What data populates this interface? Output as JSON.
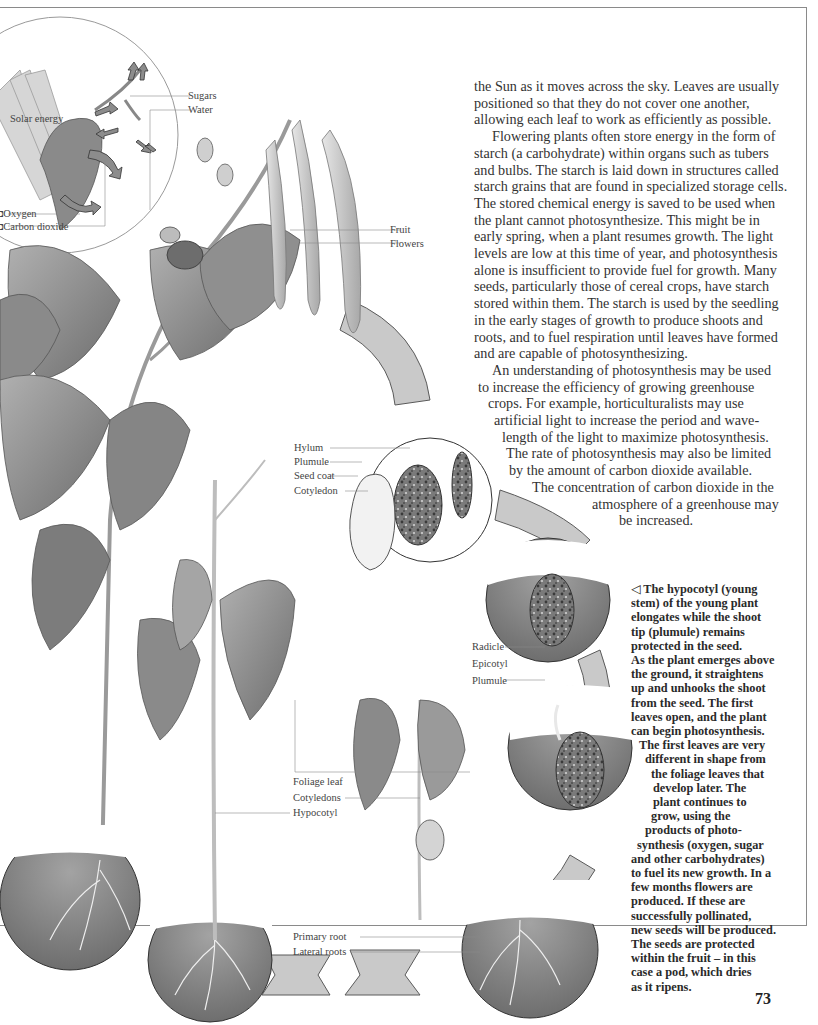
{
  "page": {
    "number": "73"
  },
  "body_text": {
    "paragraphs": [
      {
        "lines": [
          "the Sun as it moves across the sky. Leaves are usually",
          "positioned so that they do not cover one another,",
          "allowing each leaf to work as efficiently as possible."
        ]
      },
      {
        "lines": [
          "Flowering plants often store energy in the form of",
          "starch (a carbohydrate) within organs such as tubers",
          "and bulbs. The starch is laid down in structures called",
          "starch grains that are found in specialized storage cells.",
          "The stored chemical energy is saved to be used when",
          "the plant cannot photosynthesize. This might be in",
          "early spring, when a plant resumes growth. The light",
          "levels are low at this time of year, and photosynthesis",
          "alone is insufficient to provide fuel for growth. Many",
          "seeds, particularly those of cereal crops, have starch",
          "stored within them. The starch is used by the seedling",
          "in the early stages of growth to produce shoots and",
          "roots, and to fuel respiration until leaves have formed",
          "and are capable of photosynthesizing."
        ]
      },
      {
        "lines": [
          "An understanding of photosynthesis may be used",
          "to increase the efficiency of growing greenhouse",
          "crops. For example, horticulturalists may use",
          "artificial light to increase the period and wave-",
          "length of the light to maximize photosynthesis.",
          "The rate of photosynthesis may also be limited",
          "by the amount of carbon dioxide available.",
          "The concentration of carbon dioxide in the",
          "atmosphere of a greenhouse may",
          "be increased."
        ]
      }
    ]
  },
  "caption": {
    "marker": "◁",
    "lines": [
      "The hypocotyl (young",
      "stem) of the young plant",
      "elongates while the shoot",
      "tip (plumule) remains",
      "protected in the seed.",
      "As the plant emerges above",
      "the ground, it straightens",
      "up and unhooks the shoot",
      "from the seed. The first",
      "leaves open, and the plant",
      "can begin photosynthesis.",
      "The first leaves are very",
      "different in shape from",
      "the foliage leaves that",
      "develop later. The",
      "plant continues to",
      "grow, using the",
      "products of photo-",
      "synthesis (oxygen, sugar",
      "and other carbohydrates)",
      "to fuel its new growth. In a",
      "few months flowers are",
      "produced. If these are",
      "successfully pollinated,",
      "new seeds will be produced.",
      "The seeds are protected",
      "within the fruit – in this",
      "case a pod, which dries",
      "as it ripens."
    ]
  },
  "diagram_labels": {
    "inset": {
      "solar_energy": "Solar energy",
      "sugars": "Sugars",
      "water": "Water",
      "oxygen": "Oxygen",
      "carbon_dioxide": "Carbon dioxide"
    },
    "mature_plant": {
      "fruit": "Fruit",
      "flowers": "Flowers"
    },
    "seed": {
      "hylum": "Hylum",
      "plumule": "Plumule",
      "seed_coat": "Seed coat",
      "cotyledon": "Cotyledon"
    },
    "germination": {
      "radicle": "Radicle",
      "epicotyl": "Epicotyl",
      "plumule": "Plumule"
    },
    "seedling": {
      "foliage_leaf": "Foliage leaf",
      "cotyledons": "Cotyledons",
      "hypocotyl": "Hypocotyl"
    },
    "roots": {
      "primary_root": "Primary root",
      "lateral_roots": "Lateral roots"
    }
  },
  "colors": {
    "leaf": "#9a9a9a",
    "leaf_dark": "#6f6f6f",
    "arrow_fill": "#c8c8c8",
    "soil": "#8c8c8c",
    "frame": "#8a8a8a",
    "text": "#333333"
  }
}
